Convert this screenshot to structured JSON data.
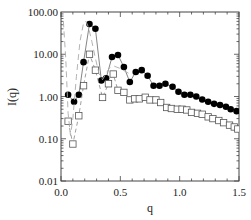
{
  "chart_data": {
    "type": "line",
    "title": "",
    "xlabel": "q",
    "ylabel": "I(q)",
    "xlim": [
      0.0,
      1.5
    ],
    "ylim": [
      0.01,
      100.0
    ],
    "yscale": "log",
    "grid": false,
    "legend": null,
    "x_ticks": [
      "0.0",
      "0.5",
      "1.0",
      "1.5"
    ],
    "y_ticks": [
      "0.01",
      "0.10",
      "1.00",
      "10.00",
      "100.00"
    ],
    "series": [
      {
        "name": "filled-circles",
        "marker": "filled-circle",
        "line": "solid",
        "color": "#000000",
        "x": [
          0.06,
          0.11,
          0.15,
          0.19,
          0.24,
          0.29,
          0.34,
          0.38,
          0.43,
          0.48,
          0.53,
          0.58,
          0.63,
          0.68,
          0.73,
          0.78,
          0.83,
          0.88,
          0.94,
          0.99,
          1.04,
          1.09,
          1.14,
          1.19,
          1.24,
          1.29,
          1.34,
          1.39,
          1.43,
          1.48
        ],
        "y": [
          1.1,
          0.75,
          1.1,
          6.5,
          52,
          40,
          2.4,
          2.7,
          8.6,
          9.6,
          5.0,
          2.2,
          3.8,
          4.2,
          3.1,
          1.8,
          1.8,
          2.0,
          1.7,
          1.3,
          1.1,
          1.1,
          1.0,
          0.85,
          0.75,
          0.67,
          0.63,
          0.57,
          0.5,
          0.45
        ]
      },
      {
        "name": "open-squares",
        "marker": "open-square",
        "line": "dashed",
        "color": "#666666",
        "x": [
          0.06,
          0.1,
          0.15,
          0.19,
          0.24,
          0.29,
          0.35,
          0.4,
          0.44,
          0.48,
          0.53,
          0.58,
          0.62,
          0.66,
          0.71,
          0.75,
          0.8,
          0.84,
          0.89,
          0.93,
          0.98,
          1.02,
          1.06,
          1.1,
          1.15,
          1.19,
          1.24,
          1.28,
          1.33,
          1.37,
          1.42,
          1.46,
          1.49
        ],
        "y": [
          0.26,
          0.075,
          0.35,
          1.8,
          10,
          4.2,
          0.95,
          2.0,
          3.4,
          1.4,
          1.25,
          0.83,
          0.88,
          0.88,
          0.96,
          0.83,
          0.83,
          0.72,
          0.55,
          0.52,
          0.5,
          0.5,
          0.48,
          0.42,
          0.4,
          0.38,
          0.33,
          0.3,
          0.27,
          0.24,
          0.21,
          0.19,
          0.17
        ]
      },
      {
        "name": "dashed-model-curve",
        "marker": "none",
        "line": "long-dash",
        "color": "#999999",
        "x": [
          0.02,
          0.04,
          0.06,
          0.08,
          0.1,
          0.13,
          0.16,
          0.19,
          0.21,
          0.23,
          0.26,
          0.29,
          0.32,
          0.35,
          0.38,
          0.41,
          0.45,
          0.5,
          0.55,
          0.6
        ],
        "y": [
          60,
          8,
          0.4,
          0.12,
          0.3,
          3,
          20,
          55,
          60,
          45,
          20,
          8,
          3.5,
          2.5,
          3.5,
          4.8,
          5.2,
          4.6,
          3.8,
          3.2
        ]
      }
    ]
  }
}
